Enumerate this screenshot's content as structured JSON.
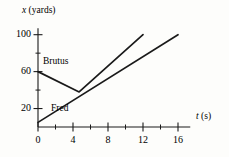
{
  "figure": {
    "name": "position-vs-time-graph",
    "background_color": "#fdfdfb",
    "ink_color": "#1a1a1a"
  },
  "chart_data": {
    "type": "line",
    "title": "",
    "subtitle": "",
    "xlabel": "t (s)",
    "ylabel": "x (yards)",
    "xlabel_variable": "t",
    "xlabel_units": "(s)",
    "ylabel_variable": "x",
    "ylabel_units": "(yards)",
    "xlim": [
      0,
      17.6
    ],
    "ylim": [
      0,
      108
    ],
    "grid": false,
    "legend": "inline-labels",
    "x_major_ticks": [
      0,
      4,
      8,
      12,
      16
    ],
    "x_minor_ticks": [
      2,
      6,
      10,
      14
    ],
    "x_tick_labels": [
      "0",
      "4",
      "8",
      "12",
      "16"
    ],
    "y_major_ticks": [
      20,
      60,
      100
    ],
    "y_minor_ticks": [
      40,
      80
    ],
    "y_tick_labels": [
      "20",
      "60",
      "100"
    ],
    "series": [
      {
        "name": "Brutus",
        "label": "Brutus",
        "points": [
          [
            0,
            60
          ],
          [
            4.7,
            38
          ],
          [
            12,
            100
          ]
        ],
        "color": "#1a1a1a"
      },
      {
        "name": "Fred",
        "label": "Fred",
        "points": [
          [
            0,
            5
          ],
          [
            16,
            100
          ]
        ],
        "color": "#1a1a1a"
      }
    ],
    "annotations": [
      {
        "text": "Brutus",
        "x": 1.3,
        "y": 66
      },
      {
        "text": "Fred",
        "x": 2.3,
        "y": 18
      }
    ]
  }
}
